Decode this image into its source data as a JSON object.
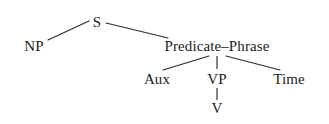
{
  "figure": {
    "kind": "syntax-tree-diagram",
    "background_color": "#ffffff",
    "line_color": "#2b2b2b",
    "text_color": "#1c1c1c"
  },
  "nodes": {
    "s": "S",
    "np": "NP",
    "predicate_phrase": "Predicate–Phrase",
    "aux": "Aux",
    "vp": "VP",
    "time": "Time",
    "v": "V"
  },
  "edges": [
    {
      "from": "S",
      "to": "NP"
    },
    {
      "from": "S",
      "to": "Predicate–Phrase"
    },
    {
      "from": "Predicate–Phrase",
      "to": "Aux"
    },
    {
      "from": "Predicate–Phrase",
      "to": "VP"
    },
    {
      "from": "Predicate–Phrase",
      "to": "Time"
    },
    {
      "from": "VP",
      "to": "V"
    }
  ]
}
